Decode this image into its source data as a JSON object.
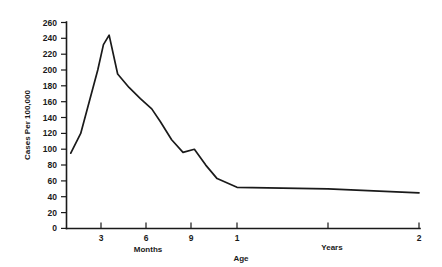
{
  "chart_data": {
    "type": "line",
    "title": "",
    "xlabel": "Age",
    "ylabel": "Cases Per 100,000",
    "ylim": [
      0,
      260
    ],
    "grid": false,
    "legend": "none",
    "line_color": "#1a1a1a",
    "background_color": "#ffffff",
    "y_ticks": [
      0,
      20,
      40,
      60,
      80,
      100,
      120,
      140,
      160,
      180,
      200,
      220,
      240,
      260
    ],
    "y_tick_labels": [
      "0",
      "20",
      "40",
      "60",
      "80",
      "100",
      "120",
      "140",
      "160",
      "180",
      "200",
      "220",
      "240",
      "260"
    ],
    "x_tick_labels": [
      "3",
      "6",
      "9",
      "1",
      "2"
    ],
    "x_tick_units": [
      "Months",
      "Months",
      "Months",
      "Years",
      "Years"
    ],
    "x_group_labels": [
      "Months",
      "Years"
    ],
    "x_axis_caption": "Age",
    "x_months": [
      0.3,
      1.0,
      1.6,
      2.2,
      2.6,
      3.0,
      3.6,
      4.4,
      5.2,
      6.0,
      6.6,
      7.4,
      8.2,
      9.0,
      9.8,
      10.6,
      12.0,
      18.0,
      24.0
    ],
    "values": [
      95,
      120,
      160,
      200,
      232,
      244,
      195,
      178,
      164,
      151,
      135,
      112,
      96,
      100,
      80,
      63,
      52,
      50,
      45
    ],
    "annotations": [
      {
        "label": "peak",
        "x_months": 3.0,
        "value": 244
      },
      {
        "label": "secondary-bump",
        "x_months": 9.0,
        "value": 100
      },
      {
        "label": "plateau-start",
        "x_months": 12.0,
        "value": 52
      }
    ]
  },
  "axes": {
    "y_label": "Cases Per 100,000",
    "x_label": "Age",
    "months_label": "Months",
    "years_label": "Years"
  }
}
